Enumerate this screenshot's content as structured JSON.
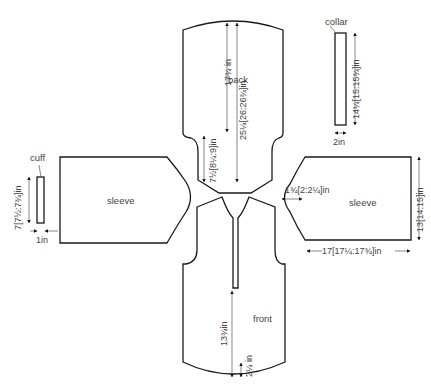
{
  "diagram": {
    "pieces": {
      "back": "back",
      "front": "front",
      "sleeve_left": "sleeve",
      "sleeve_right": "sleeve",
      "collar": "collar",
      "cuff": "cuff"
    },
    "dimensions": {
      "back_armhole_to_top": "17¾ in",
      "back_total_length": "25¼[26:26¾]in",
      "back_lower_width": "7½[8¼:9]in",
      "collar_length": "14¼[15:15¾]in",
      "collar_width": "2in",
      "cuff_length": "7[7½:7¾]in",
      "cuff_width": "1in",
      "sleeve_cap_depth": "1¾[2:2¼]in",
      "sleeve_width": "13[14:15]in",
      "sleeve_length": "17[17¼:17¾]in",
      "front_placket_to_hem": "13¾in",
      "front_hem_curve": "2¼ in"
    }
  }
}
